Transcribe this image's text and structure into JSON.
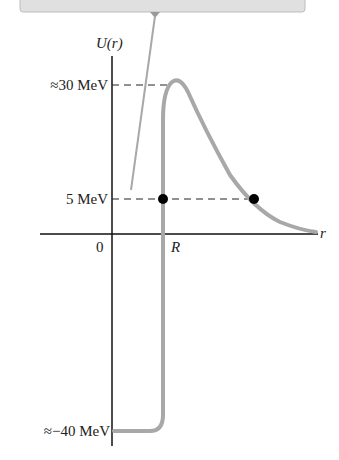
{
  "diagram": {
    "y_axis_label": "U(r)",
    "x_axis_label": "r",
    "origin_label": "0",
    "R_label": "R",
    "levels": [
      {
        "label": "≈30 MeV",
        "value": 30
      },
      {
        "label": "5 MeV",
        "value": 5
      },
      {
        "label": "≈−40 MeV",
        "value": -40
      }
    ],
    "colors": {
      "curve": "#a8a8a8",
      "axis": "#111111",
      "box": "#dcdcdc",
      "dots": "#000000"
    }
  }
}
